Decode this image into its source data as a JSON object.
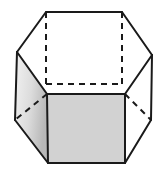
{
  "figure": {
    "name": "hexagonal-prism",
    "background_color": "#ffffff",
    "stroke_color": "#1a1a1a",
    "stroke_width": 2,
    "hidden_edge_style": "dashed",
    "hidden_edge_dash": "6 5",
    "canvas": {
      "width": 166,
      "height": 176
    }
  },
  "faces": {
    "front": {
      "name": "front-face",
      "fill": "#d2d2d2",
      "shading": "flat",
      "points": "47,94 125,94 125,163 48,163"
    },
    "left": {
      "name": "left-face",
      "fill_start": "#f2f2f2",
      "fill_end": "#b8b8b8",
      "shading": "gradient",
      "points": "17,52 47,94 48,163 15,120"
    },
    "right": {
      "name": "right-face",
      "fill": "#ffffff",
      "shading": "none",
      "points": "125,94 152,55 151,120 125,163"
    },
    "top_back_left": {
      "name": "top-left-face",
      "fill": "#ffffff",
      "points": "46,12 122,12 125,94 47,94 17,52"
    }
  },
  "edges": {
    "visible": [
      {
        "name": "edge-top",
        "d": "M46,12 L122,12"
      },
      {
        "name": "edge-top-right-upper",
        "d": "M122,12 L152,55"
      },
      {
        "name": "edge-right-silhouette",
        "d": "M152,55 L151,120"
      },
      {
        "name": "edge-bottom-right-lower",
        "d": "M151,120 L125,163"
      },
      {
        "name": "edge-bottom",
        "d": "M125,163 L48,163"
      },
      {
        "name": "edge-bottom-left-lower",
        "d": "M48,163 L15,120"
      },
      {
        "name": "edge-left-silhouette",
        "d": "M15,120 L17,52"
      },
      {
        "name": "edge-top-left-upper",
        "d": "M17,52 L46,12"
      },
      {
        "name": "edge-front-top",
        "d": "M47,94 L125,94"
      },
      {
        "name": "edge-front-left-vertical",
        "d": "M47,94 L48,163"
      },
      {
        "name": "edge-front-right-vertical",
        "d": "M125,94 L125,163"
      },
      {
        "name": "edge-left-top-diagonal",
        "d": "M17,52 L47,94"
      },
      {
        "name": "edge-right-top-diagonal",
        "d": "M152,55 L125,94"
      }
    ],
    "hidden": [
      {
        "name": "hidden-back-left-vertical",
        "d": "M46,12 L46,84"
      },
      {
        "name": "hidden-back-right-vertical",
        "d": "M122,12 L122,84"
      },
      {
        "name": "hidden-back-horizontal",
        "d": "M46,84 L122,84"
      },
      {
        "name": "hidden-left-bottom-diagonal",
        "d": "M47,94 L15,120"
      },
      {
        "name": "hidden-right-bottom-diagonal",
        "d": "M125,94 L151,120"
      }
    ]
  }
}
